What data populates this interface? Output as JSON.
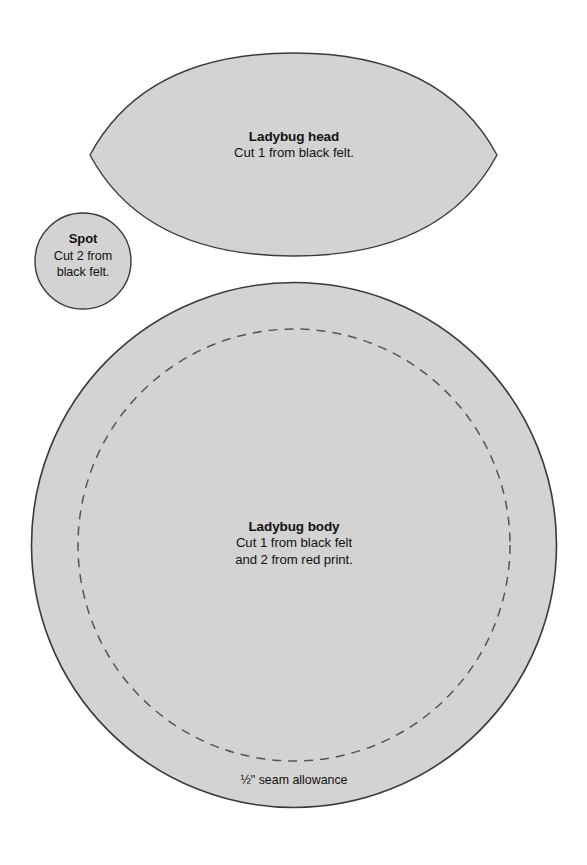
{
  "page": {
    "background_color": "#ffffff",
    "width": 587,
    "height": 865
  },
  "style": {
    "piece_fill": "#d3d3d3",
    "piece_stroke": "#3a3a3a",
    "dashed_stroke": "#555555",
    "text_color": "#14100f"
  },
  "pieces": {
    "head": {
      "name": "ladybug-head",
      "shape": "lens",
      "title": "Ladybug head",
      "instruction_line_1": "Cut 1 from black felt.",
      "bounds": {
        "left": 90,
        "top": 53,
        "right": 497,
        "bottom": 256
      }
    },
    "spot": {
      "name": "ladybug-spot",
      "shape": "circle",
      "title": "Spot",
      "instruction_line_1": "Cut 2 from",
      "instruction_line_2": "black felt.",
      "center": {
        "cx": 83,
        "cy": 261
      },
      "radius": 48
    },
    "body": {
      "name": "ladybug-body",
      "shape": "circle",
      "title": "Ladybug body",
      "instruction_line_1": "Cut 1 from black felt",
      "instruction_line_2": "and 2 from red print.",
      "center": {
        "cx": 294,
        "cy": 545
      },
      "radius": 263,
      "seam_allowance_label": "½\" seam allowance",
      "seam_allowance_radius": 216,
      "seam_line_style": "dashed"
    }
  }
}
